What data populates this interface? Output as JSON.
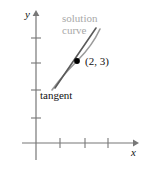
{
  "figure": {
    "width": 146,
    "height": 182,
    "background": "#ffffff"
  },
  "axes": {
    "x_label": "x",
    "y_label": "y",
    "axis_color": "#777777",
    "origin": {
      "x": 36,
      "y": 143
    },
    "x_axis": {
      "start_x": 22,
      "end_x": 136,
      "y": 143,
      "arrow": true
    },
    "y_axis": {
      "x": 36,
      "start_y": 160,
      "end_y": 12,
      "arrow": true
    },
    "x_ticks": [
      60,
      85,
      108
    ],
    "y_ticks": [
      118,
      90,
      63,
      38
    ],
    "tick_color": "#777777"
  },
  "curves": [
    {
      "name": "solution-curve",
      "color": "#9a9a9a",
      "kind": "curve",
      "path": "M 52 90 C 62 76, 70 68, 78 60 C 86 52, 94 42, 100 29"
    },
    {
      "name": "tangent-line",
      "color": "#5a5a5a",
      "kind": "line",
      "path": "M 55 88 L 96 28"
    }
  ],
  "point": {
    "name": "point-2-3",
    "label": "(2, 3)",
    "x": 77,
    "y": 61,
    "radius": 2.8,
    "color": "#000000"
  },
  "annotations": {
    "solution_curve": {
      "line1": "solution",
      "line2": "curve",
      "color": "#a8a8a8"
    },
    "tangent": {
      "text": "tangent",
      "color": "#111111"
    }
  }
}
